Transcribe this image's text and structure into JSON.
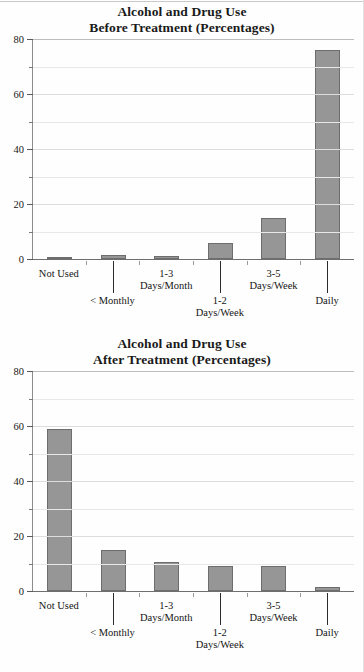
{
  "document": {
    "kind": "two-panel-bar-figure"
  },
  "colors": {
    "bar_fill": "#969696",
    "bar_stroke": "#6d6d6d",
    "gridline": "#e8e8e8",
    "axis": "#6f6f6f",
    "text": "#141414",
    "page_background": "#fefefe"
  },
  "charts": [
    {
      "id": "before-treatment",
      "title_line1": "Alcohol and Drug Use",
      "title_line2": "Before Treatment (Percentages)",
      "ylabel": "",
      "xlabel": "",
      "yticks": [
        "0",
        "20",
        "40",
        "60",
        "80"
      ],
      "ylim": [
        0,
        80
      ],
      "categories": [
        {
          "line1": "Not Used",
          "line2": "",
          "row": "a"
        },
        {
          "line1": "< Monthly",
          "line2": "",
          "row": "b"
        },
        {
          "line1": "1-3",
          "line2": "Days/Month",
          "row": "a"
        },
        {
          "line1": "1-2",
          "line2": "Days/Week",
          "row": "b"
        },
        {
          "line1": "3-5",
          "line2": "Days/Week",
          "row": "a"
        },
        {
          "line1": "Daily",
          "line2": "",
          "row": "b"
        }
      ],
      "values": [
        0.3,
        1.3,
        1.2,
        6,
        15,
        76
      ]
    },
    {
      "id": "after-treatment",
      "title_line1": "Alcohol and Drug Use",
      "title_line2": "After Treatment (Percentages)",
      "ylabel": "",
      "xlabel": "",
      "yticks": [
        "0",
        "20",
        "40",
        "60",
        "80"
      ],
      "ylim": [
        0,
        80
      ],
      "categories": [
        {
          "line1": "Not Used",
          "line2": "",
          "row": "a"
        },
        {
          "line1": "< Monthly",
          "line2": "",
          "row": "b"
        },
        {
          "line1": "1-3",
          "line2": "Days/Month",
          "row": "a"
        },
        {
          "line1": "1-2",
          "line2": "Days/Week",
          "row": "b"
        },
        {
          "line1": "3-5",
          "line2": "Days/Week",
          "row": "a"
        },
        {
          "line1": "Daily",
          "line2": "",
          "row": "b"
        }
      ],
      "values": [
        59,
        15,
        10.5,
        9,
        9,
        1.5
      ]
    }
  ],
  "chart_data": [
    {
      "type": "bar",
      "title": "Alcohol and Drug Use Before Treatment (Percentages)",
      "xlabel": "",
      "ylabel": "Percentage",
      "ylim": [
        0,
        80
      ],
      "yticks": [
        0,
        20,
        40,
        60,
        80
      ],
      "minor_yticks": [
        10,
        30,
        50,
        70
      ],
      "grid": true,
      "legend": "none",
      "categories": [
        "Not Used",
        "< Monthly",
        "1-3 Days/Month",
        "1-2 Days/Week",
        "3-5 Days/Week",
        "Daily"
      ],
      "values": [
        0.3,
        1.3,
        1.2,
        6,
        15,
        76
      ]
    },
    {
      "type": "bar",
      "title": "Alcohol and Drug Use After Treatment (Percentages)",
      "xlabel": "",
      "ylabel": "Percentage",
      "ylim": [
        0,
        80
      ],
      "yticks": [
        0,
        20,
        40,
        60,
        80
      ],
      "minor_yticks": [
        10,
        30,
        50,
        70
      ],
      "grid": true,
      "legend": "none",
      "categories": [
        "Not Used",
        "< Monthly",
        "1-3 Days/Month",
        "1-2 Days/Week",
        "3-5 Days/Week",
        "Daily"
      ],
      "values": [
        59,
        15,
        10.5,
        9,
        9,
        1.5
      ]
    }
  ]
}
